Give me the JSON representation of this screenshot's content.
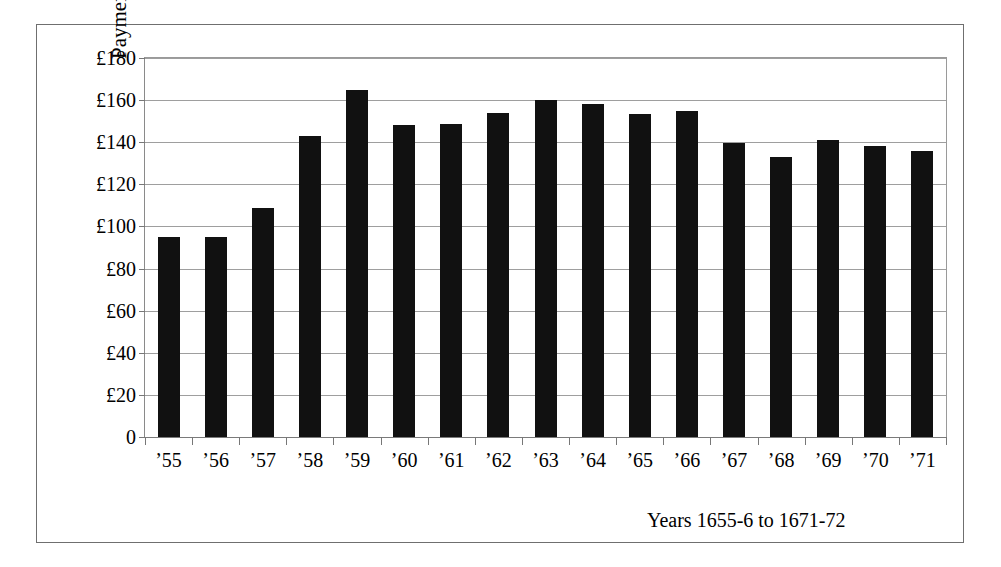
{
  "chart_data": {
    "type": "bar",
    "title": "",
    "subtitle": "",
    "xlabel": "Years 1655-6 to 1671-72",
    "ylabel": "Payments",
    "categories": [
      "’55",
      "’56",
      "’57",
      "’58",
      "’59",
      "’60",
      "’61",
      "’62",
      "’63",
      "’64",
      "’65",
      "’66",
      "’67",
      "’68",
      "’69",
      "’70",
      "’71"
    ],
    "values": [
      95,
      95,
      109,
      143,
      165,
      148,
      148.5,
      154,
      160,
      158,
      153.5,
      155,
      139.5,
      133,
      141,
      138,
      136
    ],
    "ylim": [
      0,
      180
    ],
    "ytick_values": [
      0,
      20,
      40,
      60,
      80,
      100,
      120,
      140,
      160,
      180
    ],
    "ytick_labels": [
      "0",
      "£20",
      "£40",
      "£60",
      "£80",
      "£100",
      "£120",
      "£140",
      "£160",
      "£180"
    ],
    "currency_symbol": "£",
    "grid": true,
    "grid_axis": "y",
    "legend": false,
    "legend_position": "none",
    "bar_color": "#111111",
    "gridline_color": "#9e9e9e",
    "axis_color": "#7a7a7a",
    "frame_color": "#6f6f6f",
    "background_color": "#ffffff"
  },
  "figure": {
    "y_axis_title": "Payments",
    "x_axis_caption": "Years 1655-6 to 1671-72"
  }
}
